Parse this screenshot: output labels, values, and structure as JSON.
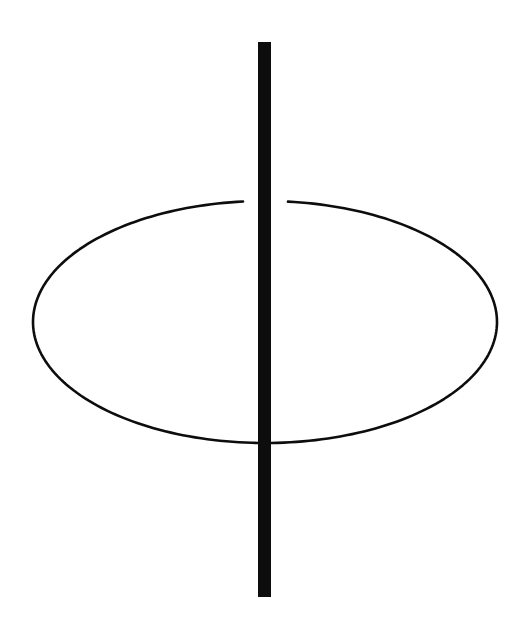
{
  "figure": {
    "title": "Phi symbol line drawing",
    "background_color": "#ffffff",
    "stroke_color": "#0d0d0d",
    "canvas": {
      "width": 529,
      "height": 626
    },
    "shapes": [
      {
        "name": "ellipse-outline",
        "type": "ellipse",
        "center_x": 265,
        "center_y": 322,
        "radius_x": 232,
        "radius_y": 121,
        "stroke_color": "#0d0d0d",
        "stroke_width": 2.6,
        "fill": "none",
        "gap_top_start_x": 243,
        "gap_top_end_x": 288
      },
      {
        "name": "vertical-bar",
        "type": "line",
        "x": 264.5,
        "y_start": 42,
        "y_end": 597,
        "stroke_color": "#0d0d0d",
        "stroke_width": 13,
        "fill": "none"
      }
    ]
  }
}
